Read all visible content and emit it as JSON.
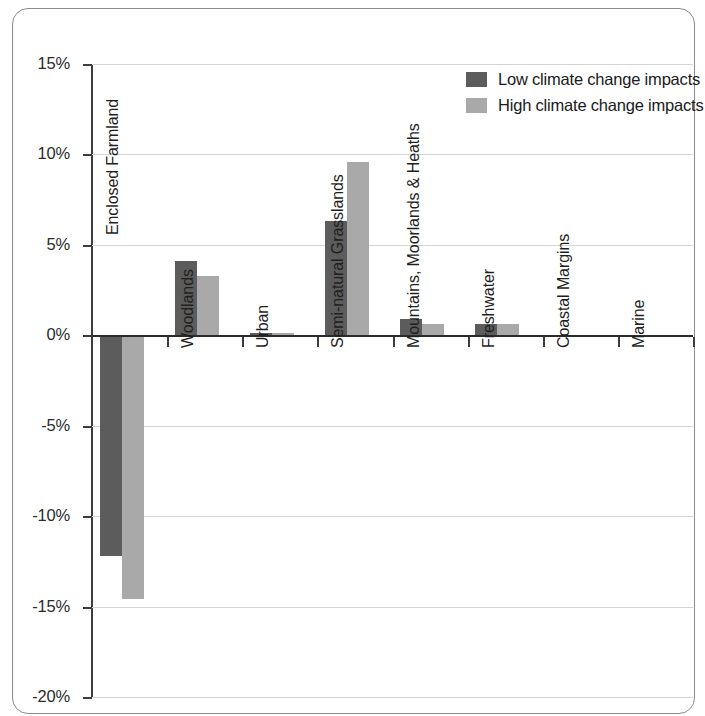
{
  "chart_data": {
    "type": "bar",
    "title": "",
    "subtitle": "",
    "xlabel": "",
    "ylabel": "",
    "ylim": [
      -20,
      15
    ],
    "y_tick_labels": [
      "15%",
      "10%",
      "5%",
      "0%",
      "-5%",
      "-10%",
      "-15%",
      "-20%"
    ],
    "y_ticks": [
      15,
      10,
      5,
      0,
      -5,
      -10,
      -15,
      -20
    ],
    "y_unit": "%",
    "grid": true,
    "grid_axis": "y",
    "legend_position": "top-right",
    "categories": [
      "Enclosed Farmland",
      "Woodlands",
      "Urban",
      "Semi-natural Grasslands",
      "Mountains, Moorlands & Heaths",
      "Freshwater",
      "Coastal Margins",
      "Marine"
    ],
    "series": [
      {
        "name": "Low climate change impacts",
        "color": "#5c5c5c",
        "values": [
          -12.2,
          4.1,
          0.1,
          6.3,
          0.9,
          0.65,
          0,
          0
        ]
      },
      {
        "name": "High climate change impacts",
        "color": "#a9a9a9",
        "values": [
          -14.6,
          3.3,
          0.1,
          9.6,
          0.65,
          0.6,
          0,
          0
        ]
      }
    ]
  },
  "legend": {
    "items": [
      {
        "label": "Low climate change impacts",
        "color": "#5c5c5c"
      },
      {
        "label": "High climate change impacts",
        "color": "#a9a9a9"
      }
    ]
  },
  "colors": {
    "low_impact": "#5c5c5c",
    "high_impact": "#a9a9a9",
    "axis": "#3d3d3d",
    "grid": "#d4d4d4",
    "frame": "#8c8c8c"
  }
}
